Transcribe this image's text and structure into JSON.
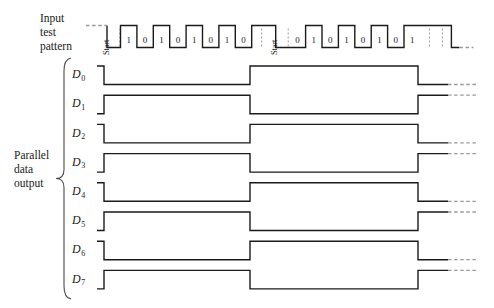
{
  "figure": {
    "type": "digital-timing-diagram",
    "width": 494,
    "height": 308,
    "background_color": "#ffffff",
    "line_color": "#1a1a1a"
  },
  "input_label": {
    "line1": "Input",
    "line2": "test",
    "line3": "pattern"
  },
  "parallel_label": {
    "line1": "Parallel",
    "line2": "data",
    "line3": "output"
  },
  "input_pattern": {
    "start_marker_1": "Start",
    "start_marker_2": "Start",
    "frame1_bits": [
      "1",
      "0",
      "1",
      "0",
      "1",
      "0",
      "1",
      "0"
    ],
    "frame2_bits": [
      "0",
      "1",
      "0",
      "1",
      "0",
      "1",
      "0",
      "1"
    ]
  },
  "data_lines": [
    {
      "name": "D",
      "index": "0",
      "levels": [
        1,
        0,
        1,
        0
      ]
    },
    {
      "name": "D",
      "index": "1",
      "levels": [
        0,
        1,
        0,
        1
      ]
    },
    {
      "name": "D",
      "index": "2",
      "levels": [
        1,
        0,
        1,
        0
      ]
    },
    {
      "name": "D",
      "index": "3",
      "levels": [
        0,
        1,
        0,
        1
      ]
    },
    {
      "name": "D",
      "index": "4",
      "levels": [
        1,
        0,
        1,
        0
      ]
    },
    {
      "name": "D",
      "index": "5",
      "levels": [
        0,
        1,
        0,
        1
      ]
    },
    {
      "name": "D",
      "index": "6",
      "levels": [
        1,
        0,
        1,
        0
      ]
    },
    {
      "name": "D",
      "index": "7",
      "levels": [
        0,
        1,
        0,
        1
      ]
    }
  ],
  "chart_data": {
    "type": "line",
    "title": "",
    "xlabel": "",
    "ylabel": "",
    "series": [
      {
        "name": "Input test pattern",
        "values": [
          "Start",
          "1",
          "0",
          "1",
          "0",
          "1",
          "0",
          "1",
          "0",
          "Start",
          "0",
          "1",
          "0",
          "1",
          "0",
          "1",
          "0",
          "1"
        ]
      },
      {
        "name": "D0",
        "values": [
          1,
          0,
          1,
          0
        ]
      },
      {
        "name": "D1",
        "values": [
          0,
          1,
          0,
          1
        ]
      },
      {
        "name": "D2",
        "values": [
          1,
          0,
          1,
          0
        ]
      },
      {
        "name": "D3",
        "values": [
          0,
          1,
          0,
          1
        ]
      },
      {
        "name": "D4",
        "values": [
          1,
          0,
          1,
          0
        ]
      },
      {
        "name": "D5",
        "values": [
          0,
          1,
          0,
          1
        ]
      },
      {
        "name": "D6",
        "values": [
          1,
          0,
          1,
          0
        ]
      },
      {
        "name": "D7",
        "values": [
          0,
          1,
          0,
          1
        ]
      }
    ]
  }
}
